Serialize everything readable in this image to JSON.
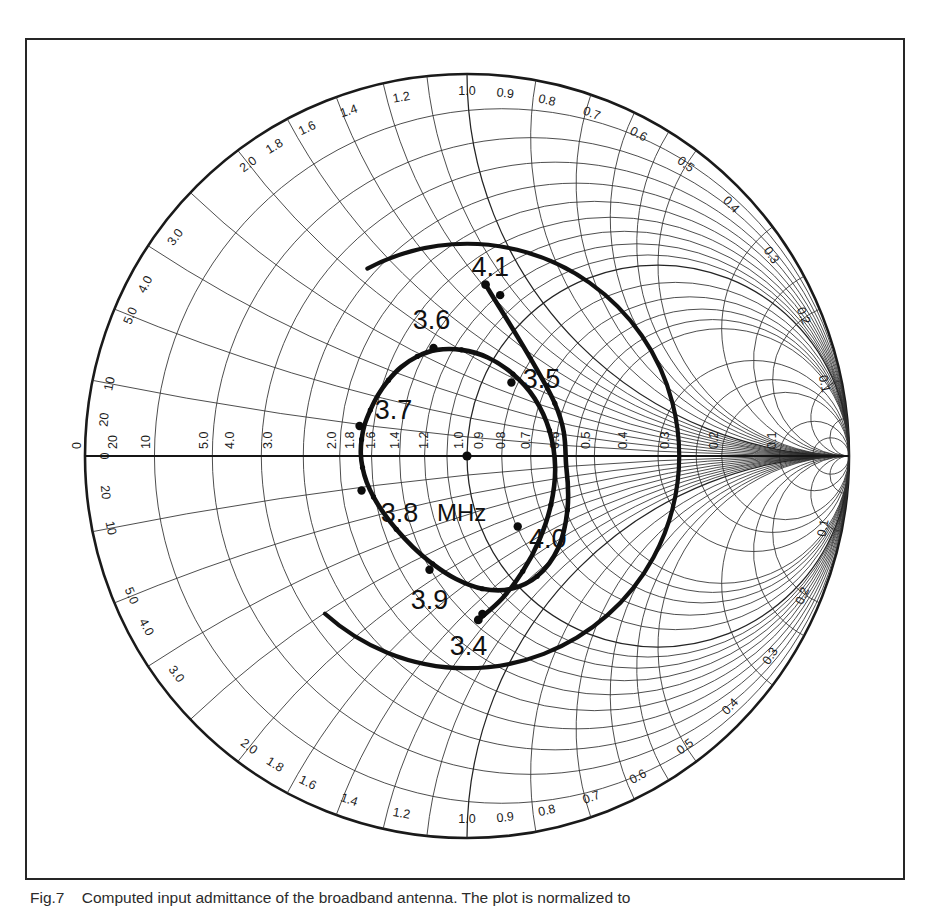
{
  "figure": {
    "caption_label": "Fig.7",
    "caption_text": "Computed input admittance of the broadband antenna. The plot is normalized to",
    "units_label": "MHz"
  },
  "chart_data": {
    "type": "scatter",
    "chart_kind": "smith-chart",
    "title": "Computed input admittance of the broadband antenna",
    "xlabel": "",
    "ylabel": "",
    "grid": true,
    "legend_position": "none",
    "center_normalized_value": "1.0",
    "axis_resistance_ticks": [
      "0",
      "0.1",
      "0.2",
      "0.3",
      "0.4",
      "0.5",
      "0.6",
      "0.7",
      "0.8",
      "0.9",
      "1.0",
      "1.2",
      "1.4",
      "1.6",
      "1.8",
      "2.0",
      "3.0",
      "4.0",
      "5.0",
      "10",
      "20"
    ],
    "rim_reactance_ticks_upper": [
      "0",
      "0.1",
      "0.2",
      "0.3",
      "0.4",
      "0.5",
      "0.6",
      "0.7",
      "0.8",
      "0.9",
      "1.0",
      "1.2",
      "1.4",
      "1.6",
      "1.8",
      "2.0",
      "3.0",
      "4.0",
      "5.0",
      "10",
      "20"
    ],
    "rim_reactance_ticks_lower": [
      "0",
      "0.1",
      "0.2",
      "0.3",
      "0.4",
      "0.5",
      "0.6",
      "0.7",
      "0.8",
      "0.9",
      "1.0",
      "1.2",
      "1.4",
      "1.6",
      "1.8",
      "2.0",
      "3.0",
      "4.0",
      "5.0",
      "10",
      "20"
    ],
    "resistance_circles": [
      0.1,
      0.2,
      0.3,
      0.4,
      0.5,
      0.6,
      0.7,
      0.8,
      0.9,
      1.0,
      1.2,
      1.4,
      1.6,
      1.8,
      2.0,
      3.0,
      4.0,
      5.0,
      10,
      20
    ],
    "reactance_arcs": [
      0.1,
      0.2,
      0.3,
      0.4,
      0.5,
      0.6,
      0.7,
      0.8,
      0.9,
      1.0,
      1.2,
      1.4,
      1.6,
      1.8,
      2.0,
      3.0,
      4.0,
      5.0,
      10,
      20
    ],
    "vswr_circle": {
      "label": "",
      "swr": 3.5,
      "drawn_arc_degrees": 250
    },
    "frequency_markers": [
      {
        "label": "3.4",
        "unit": "MHz",
        "g": 0.66,
        "b": -0.66,
        "label_dx": -14,
        "label_dy": 34
      },
      {
        "label": "3.5",
        "unit": "MHz",
        "g": 0.74,
        "b": 0.3,
        "label_dx": 30,
        "label_dy": -2
      },
      {
        "label": "3.6",
        "unit": "MHz",
        "g": 1.0,
        "b": 0.62,
        "label_dx": -2,
        "label_dy": -26
      },
      {
        "label": "3.7",
        "unit": "MHz",
        "g": 1.75,
        "b": 0.3,
        "label_dx": 34,
        "label_dy": -14
      },
      {
        "label": "3.8",
        "unit": "MHz",
        "g": 1.72,
        "b": -0.34,
        "label_dx": 38,
        "label_dy": 24
      },
      {
        "label": "3.9",
        "unit": "MHz",
        "g": 1.0,
        "b": -0.66,
        "label_dx": 0,
        "label_dy": 32
      },
      {
        "label": "4.0",
        "unit": "MHz",
        "g": 0.72,
        "b": -0.28,
        "label_dx": 30,
        "label_dy": 14
      },
      {
        "label": "4.1",
        "unit": "MHz",
        "g": 0.6,
        "b": 0.62,
        "label_dx": -10,
        "label_dy": -26
      }
    ],
    "locus_description": "Closed admittance loop for 3.4-4.1 MHz crossing itself near g=0.62 on the real axis",
    "series": [
      {
        "name": "input admittance locus",
        "points": [
          {
            "f": "3.40",
            "g": 0.655,
            "b": -0.69
          },
          {
            "f": "3.42",
            "g": 0.64,
            "b": -0.56
          },
          {
            "f": "3.44",
            "g": 0.632,
            "b": -0.43
          },
          {
            "f": "3.46",
            "g": 0.626,
            "b": -0.3
          },
          {
            "f": "3.48",
            "g": 0.622,
            "b": -0.17
          },
          {
            "f": "3.50",
            "g": 0.624,
            "b": -0.04
          },
          {
            "f": "3.52",
            "g": 0.64,
            "b": 0.09
          },
          {
            "f": "3.54",
            "g": 0.672,
            "b": 0.215
          },
          {
            "f": "3.56",
            "g": 0.722,
            "b": 0.33
          },
          {
            "f": "3.58",
            "g": 0.79,
            "b": 0.438
          },
          {
            "f": "3.60",
            "g": 0.88,
            "b": 0.53
          },
          {
            "f": "3.62",
            "g": 0.99,
            "b": 0.6
          },
          {
            "f": "3.64",
            "g": 1.11,
            "b": 0.632
          },
          {
            "f": "3.66",
            "g": 1.24,
            "b": 0.63
          },
          {
            "f": "3.68",
            "g": 1.37,
            "b": 0.592
          },
          {
            "f": "3.70",
            "g": 1.5,
            "b": 0.52
          },
          {
            "f": "3.72",
            "g": 1.61,
            "b": 0.42
          },
          {
            "f": "3.74",
            "g": 1.7,
            "b": 0.3
          },
          {
            "f": "3.76",
            "g": 1.752,
            "b": 0.165
          },
          {
            "f": "3.78",
            "g": 1.77,
            "b": 0.025
          },
          {
            "f": "3.80",
            "g": 1.748,
            "b": -0.115
          },
          {
            "f": "3.82",
            "g": 1.69,
            "b": -0.248
          },
          {
            "f": "3.84",
            "g": 1.596,
            "b": -0.368
          },
          {
            "f": "3.86",
            "g": 1.47,
            "b": -0.47
          },
          {
            "f": "3.88",
            "g": 1.325,
            "b": -0.548
          },
          {
            "f": "3.90",
            "g": 1.165,
            "b": -0.6
          },
          {
            "f": "3.92",
            "g": 1.005,
            "b": -0.622
          },
          {
            "f": "3.94",
            "g": 0.855,
            "b": -0.615
          },
          {
            "f": "3.96",
            "g": 0.73,
            "b": -0.578
          },
          {
            "f": "3.98",
            "g": 0.636,
            "b": -0.512
          },
          {
            "f": "4.00",
            "g": 0.578,
            "b": -0.42
          },
          {
            "f": "4.02",
            "g": 0.556,
            "b": -0.305
          },
          {
            "f": "4.04",
            "g": 0.564,
            "b": -0.175
          },
          {
            "f": "4.06",
            "g": 0.586,
            "b": -0.04
          },
          {
            "f": "4.08",
            "g": 0.606,
            "b": 0.18
          },
          {
            "f": "4.10",
            "g": 0.612,
            "b": 0.69
          }
        ]
      }
    ]
  }
}
